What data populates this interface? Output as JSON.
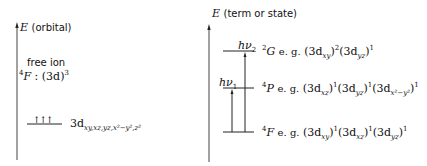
{
  "left_panel": {
    "axis_label_symbol": "E",
    "axis_label_text": "(orbital)",
    "free_ion_label": "free ion",
    "term_symbol_sup": "4",
    "term_symbol": "F",
    "config_text": ": (3d)",
    "config_sup": "3",
    "orbital_level": {
      "electrons": "↑↑↑",
      "label_main": "3d",
      "label_sub": "xy,xz,yz,x²−y²,z²"
    }
  },
  "right_panel": {
    "axis_label_symbol": "E",
    "axis_label_text": "(term or state)",
    "transitions": [
      {
        "label": "hν",
        "sub": "1"
      },
      {
        "label": "hν",
        "sub": "2"
      }
    ],
    "levels": [
      {
        "sup": "2",
        "term": "G",
        "eg": "e. g.",
        "config": "(3d_xy)²(3d_yz)¹",
        "parts": [
          {
            "b": "(3d",
            "s": "xy",
            "e": ")",
            "p": "2"
          },
          {
            "b": "(3d",
            "s": "yz",
            "e": ")",
            "p": "1"
          }
        ]
      },
      {
        "sup": "4",
        "term": "P",
        "eg": "e. g.",
        "config": "(3d_xz)¹(3d_yz)¹(3d_x²−y²)¹",
        "parts": [
          {
            "b": "(3d",
            "s": "xz",
            "e": ")",
            "p": "1"
          },
          {
            "b": "(3d",
            "s": "yz",
            "e": ")",
            "p": "1"
          },
          {
            "b": "(3d",
            "s": "x²−y²",
            "e": ")",
            "p": "1"
          }
        ]
      },
      {
        "sup": "4",
        "term": "F",
        "eg": "e. g.",
        "config": "(3d_xy)¹(3d_xz)¹(3d_yz)¹",
        "parts": [
          {
            "b": "(3d",
            "s": "xy",
            "e": ")",
            "p": "1"
          },
          {
            "b": "(3d",
            "s": "xz",
            "e": ")",
            "p": "1"
          },
          {
            "b": "(3d",
            "s": "yz",
            "e": ")",
            "p": "1"
          }
        ]
      }
    ]
  }
}
